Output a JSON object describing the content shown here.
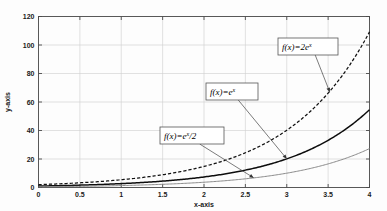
{
  "chart_data": {
    "type": "line",
    "title": "",
    "xlabel": "x-axis",
    "ylabel": "y-axis",
    "xlim": [
      0,
      4
    ],
    "ylim": [
      0,
      120
    ],
    "grid": true,
    "legend_position": "none",
    "xticks": [
      "0",
      "0.5",
      "1",
      "1.5",
      "2",
      "2.5",
      "3",
      "3.5",
      "4"
    ],
    "xtick_values": [
      0,
      0.5,
      1,
      1.5,
      2,
      2.5,
      3,
      3.5,
      4
    ],
    "yticks": [
      "0",
      "20",
      "40",
      "60",
      "80",
      "100",
      "120"
    ],
    "ytick_values": [
      0,
      20,
      40,
      60,
      80,
      100,
      120
    ],
    "series": [
      {
        "name": "f(x)=2e^x",
        "style": "dashed",
        "color": "#111111",
        "x": [
          0,
          0.25,
          0.5,
          0.75,
          1,
          1.25,
          1.5,
          1.75,
          2,
          2.25,
          2.5,
          2.75,
          3,
          3.25,
          3.5,
          3.75,
          4
        ],
        "values": [
          2,
          2.57,
          3.3,
          4.23,
          5.44,
          6.98,
          8.96,
          11.5,
          14.78,
          18.97,
          24.36,
          31.27,
          40.17,
          51.57,
          66.21,
          85.01,
          109.2
        ]
      },
      {
        "name": "f(x)=e^x",
        "style": "solid",
        "color": "#0d0d0d",
        "x": [
          0,
          0.25,
          0.5,
          0.75,
          1,
          1.25,
          1.5,
          1.75,
          2,
          2.25,
          2.5,
          2.75,
          3,
          3.25,
          3.5,
          3.75,
          4
        ],
        "values": [
          1,
          1.28,
          1.65,
          2.12,
          2.72,
          3.49,
          4.48,
          5.75,
          7.39,
          9.49,
          12.18,
          15.64,
          20.09,
          25.79,
          33.12,
          42.52,
          54.6
        ]
      },
      {
        "name": "f(x)=e^x/2",
        "style": "solid-light",
        "color": "#8a8a8a",
        "x": [
          0,
          0.25,
          0.5,
          0.75,
          1,
          1.25,
          1.5,
          1.75,
          2,
          2.25,
          2.5,
          2.75,
          3,
          3.25,
          3.5,
          3.75,
          4
        ],
        "values": [
          0.5,
          0.64,
          0.82,
          1.06,
          1.36,
          1.75,
          2.24,
          2.87,
          3.69,
          4.74,
          6.09,
          7.82,
          10.04,
          12.9,
          16.56,
          21.26,
          27.3
        ]
      }
    ],
    "annotations": [
      {
        "id": "annot-2ex",
        "prefix": "f(x)=2e",
        "sup": "x",
        "suffix": "",
        "label": "f(x)=2e^x",
        "box_x": 278,
        "box_y": 38,
        "box_w": 60,
        "box_h": 17,
        "target_x": 3.52,
        "target_y": 67.0
      },
      {
        "id": "annot-ex",
        "prefix": "f(x)=e",
        "sup": "x",
        "suffix": "",
        "label": "f(x)=e^x",
        "box_x": 206,
        "box_y": 83,
        "box_w": 52,
        "box_h": 17,
        "target_x": 3.0,
        "target_y": 20.1
      },
      {
        "id": "annot-ex2",
        "prefix": "f(x)=e",
        "sup": "x",
        "suffix": "/2",
        "label": "f(x)=e^x/2",
        "box_x": 160,
        "box_y": 127,
        "box_w": 64,
        "box_h": 17,
        "target_x": 2.6,
        "target_y": 6.8
      }
    ]
  },
  "axes": {
    "x_title": "x-axis",
    "y_title": "y-axis"
  },
  "colors": {
    "background": "#fdfdfd",
    "grid": "#cfcfcf",
    "axis": "#4a4a4a",
    "series_1": "#111111",
    "series_2": "#0d0d0d",
    "series_3": "#8a8a8a"
  }
}
